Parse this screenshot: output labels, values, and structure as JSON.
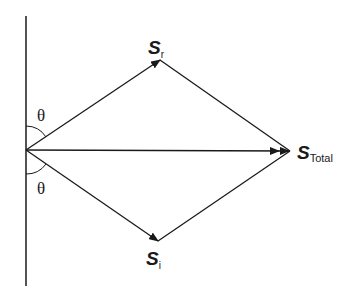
{
  "diagram": {
    "colors": {
      "stroke": "#1a1a1a",
      "background": "#ffffff"
    },
    "wall": {
      "x": 26,
      "y1": 16,
      "y2": 286
    },
    "origin": {
      "x": 26,
      "y": 150
    },
    "vectors": [
      {
        "id": "S_r",
        "from": [
          26,
          150
        ],
        "to": [
          160,
          60
        ]
      },
      {
        "id": "S_i",
        "from": [
          26,
          150
        ],
        "to": [
          158,
          241
        ]
      },
      {
        "id": "S_Total",
        "from": [
          26,
          150
        ],
        "to": [
          290,
          151
        ]
      }
    ],
    "labels": {
      "s_r": {
        "main": "S",
        "sub": "r"
      },
      "s_i": {
        "main": "S",
        "sub": "i"
      },
      "s_total": {
        "main": "S",
        "sub": "Total"
      },
      "theta_top": "θ",
      "theta_bottom": "θ"
    }
  }
}
